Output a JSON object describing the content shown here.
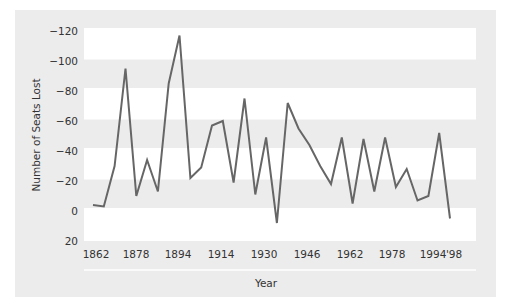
{
  "chart_data": {
    "type": "line",
    "title": "",
    "xlabel": "Year",
    "ylabel": "Number of Seats Lost",
    "ylim": [
      20,
      -120
    ],
    "y_axis_inverted": true,
    "yticks": [
      -120,
      -100,
      -80,
      -60,
      -40,
      -20,
      0,
      20
    ],
    "ytick_labels": [
      "−120",
      "−100",
      "−80",
      "−60",
      "−40",
      "−20",
      "0",
      "20"
    ],
    "xtick_labels": [
      "1862",
      "1878",
      "1894",
      "1914",
      "1930",
      "1946",
      "1962",
      "1978",
      "1994",
      "'98"
    ],
    "grid": "alternating horizontal bands",
    "legend": null,
    "series": [
      {
        "name": "Seats lost",
        "color": "#666666",
        "values": [
          -4,
          -3,
          -30,
          -95,
          -10,
          -34,
          -13,
          -85,
          -117,
          -22,
          -29,
          -57,
          -60,
          -19,
          -75,
          -11,
          -49,
          8,
          -72,
          -55,
          -44,
          -30,
          -18,
          -49,
          -5,
          -48,
          -13,
          -49,
          -16,
          -28,
          -7,
          -10,
          -52,
          5
        ]
      }
    ]
  },
  "colors": {
    "panel": "#ececec",
    "band": "#ffffff",
    "line": "#666666",
    "text": "#333333"
  }
}
